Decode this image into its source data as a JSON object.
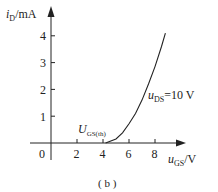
{
  "chart_data": {
    "type": "line",
    "title": "",
    "caption": "( b )",
    "xlabel": "u_GS/V",
    "ylabel": "i_D/mA",
    "x_ticks": [
      0,
      2,
      4,
      6,
      8
    ],
    "y_ticks": [
      1,
      2,
      3,
      4
    ],
    "xlim": [
      0,
      9.5
    ],
    "ylim": [
      0,
      4.5
    ],
    "grid": false,
    "series": [
      {
        "name": "u_DS=10 V",
        "x": [
          4.2,
          5.0,
          5.5,
          6.0,
          6.5,
          7.0,
          7.5,
          8.0,
          8.5,
          8.8
        ],
        "y": [
          0.0,
          0.15,
          0.38,
          0.72,
          1.1,
          1.6,
          2.2,
          2.85,
          3.6,
          4.1
        ]
      }
    ],
    "annotations": [
      {
        "text": "U_GS(th)",
        "x": 4,
        "y": 0.3
      },
      {
        "text": "u_DS=10 V",
        "x": 7.2,
        "y": 1.75
      }
    ]
  },
  "labels": {
    "y_axis_main": "i",
    "y_axis_sub": "D",
    "y_axis_unit": "/mA",
    "x_axis_main": "u",
    "x_axis_sub": "GS",
    "x_axis_unit": "/V",
    "threshold_main": "U",
    "threshold_sub": "GS(th)",
    "curve_main": "u",
    "curve_sub": "DS",
    "curve_value": "=10 V",
    "origin": "0",
    "caption": "( b )"
  }
}
